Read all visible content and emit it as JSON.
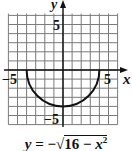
{
  "chart_data": {
    "type": "line",
    "title": "",
    "equation": "y = -sqrt(16 - x^2)",
    "xlabel": "x",
    "ylabel": "y",
    "xlim": [
      -6,
      6
    ],
    "ylim": [
      -6,
      6.5
    ],
    "grid": true,
    "grid_step": 1,
    "x_tick_labels": [
      {
        "value": -5,
        "label": "-5"
      },
      {
        "value": 5,
        "label": "5"
      }
    ],
    "y_tick_labels": [
      {
        "value": 5,
        "label": "5"
      },
      {
        "value": -5,
        "label": "-5"
      }
    ],
    "series": [
      {
        "name": "y = -sqrt(16 - x^2)",
        "x": [
          -4,
          -3.5,
          -3,
          -2,
          -1,
          0,
          1,
          2,
          3,
          3.5,
          4
        ],
        "y": [
          0,
          -1.94,
          -2.65,
          -3.46,
          -3.87,
          -4,
          -3.87,
          -3.46,
          -2.65,
          -1.94,
          0
        ]
      }
    ]
  },
  "labels": {
    "x_axis": "x",
    "y_axis": "y",
    "x_neg": "−5",
    "x_pos": "5",
    "y_pos": "5",
    "y_neg": "−5"
  },
  "caption": {
    "y": "y",
    "eq": " = −",
    "radicand_num": "16 − ",
    "radicand_var": "x",
    "exponent": "2"
  },
  "colors": {
    "grid": "#7a7a7a",
    "axis": "#111111",
    "curve": "#111111",
    "background": "#ffffff"
  }
}
